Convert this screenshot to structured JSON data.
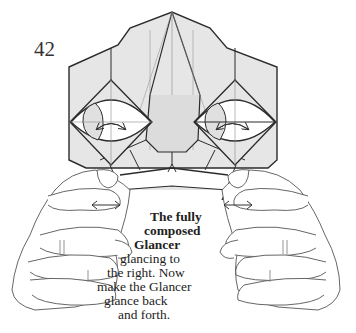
{
  "diagram": {
    "step_number": "42",
    "caption": {
      "bold_lines": [
        "The fully",
        "composed",
        "Glancer"
      ],
      "normal_lines": [
        "glancing to",
        "the right.  Now",
        "make the Glancer",
        "glance back",
        "and forth."
      ]
    },
    "colors": {
      "paper": "#e6e6e6",
      "line": "#2b2b2b",
      "thin_line": "#8a8a8a",
      "background": "#ffffff"
    },
    "elements": {
      "model": "origami-glancer-face",
      "left_eye_arrow": "double-curved-arrow",
      "right_eye_arrow": "double-curved-arrow",
      "left_hand_arrow": "double-horizontal-arrow",
      "right_hand_arrow": "double-horizontal-arrow",
      "hands": [
        "left-hand",
        "right-hand"
      ]
    }
  }
}
